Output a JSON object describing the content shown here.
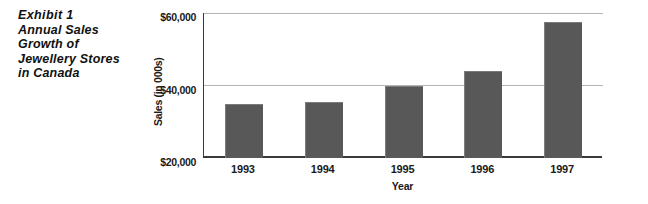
{
  "exhibit": {
    "caption_lines": [
      "Exhibit 1",
      "Annual Sales",
      "Growth of",
      "Jewellery Stores",
      "in Canada"
    ]
  },
  "chart_data": {
    "type": "bar",
    "title": "Exhibit 1 Annual Sales Growth of Jewellery Stores in Canada",
    "categories": [
      "1993",
      "1994",
      "1995",
      "1996",
      "1997"
    ],
    "values": [
      34900,
      35400,
      40000,
      44000,
      57500
    ],
    "xlabel": "Year",
    "ylabel": "Sales (in 000s)",
    "ylim": [
      20000,
      60000
    ],
    "ytick_labels": [
      "$60,000",
      "$40,000",
      "$20,000"
    ],
    "ytick_values": [
      60000,
      40000,
      20000
    ],
    "grid": true,
    "legend": false,
    "bar_color": "#585858",
    "gridline_color": "#b5b5b5",
    "axis_color": "#3a3a3a"
  }
}
